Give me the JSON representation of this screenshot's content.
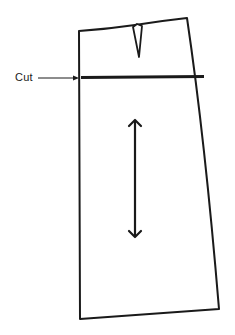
{
  "figure": {
    "type": "skirt-pattern-piece",
    "labels": {
      "cut": "Cut"
    },
    "elements": {
      "outline": "skirt-outline",
      "dart": "waist-dart",
      "cut_line": "horizontal-cut-line",
      "grain_line": "double-headed-grainline-arrow",
      "pointer": "cut-pointer-arrow"
    },
    "colors": {
      "ink": "#1a1a1a",
      "background": "#ffffff"
    }
  }
}
